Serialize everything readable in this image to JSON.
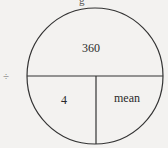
{
  "diagram": {
    "type": "formula-triangle-circle",
    "top_partial_text": "g",
    "operator_symbol": "÷",
    "sections": {
      "top": {
        "label": "360"
      },
      "bottom_left": {
        "label": "4"
      },
      "bottom_right": {
        "label": "mean"
      }
    },
    "colors": {
      "stroke": "#333333",
      "background": "#f3f2f0",
      "text": "#2a2a2a"
    }
  }
}
